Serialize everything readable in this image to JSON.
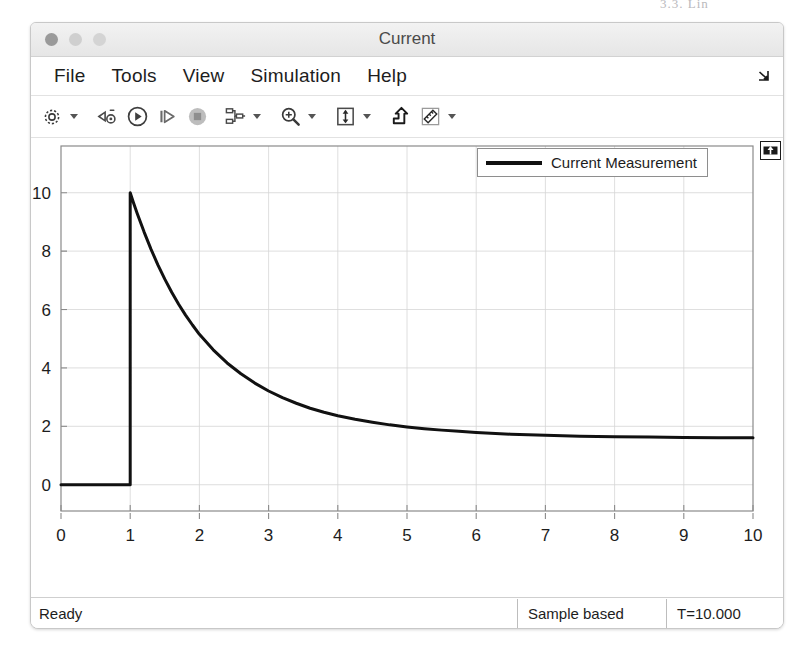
{
  "window": {
    "title": "Current",
    "traffic_lights": [
      "close-button",
      "minimize-button",
      "zoom-button"
    ],
    "top_artifact_text": "3.3. Lin"
  },
  "menubar": {
    "items": [
      {
        "label": "File",
        "name": "menu-file"
      },
      {
        "label": "Tools",
        "name": "menu-tools"
      },
      {
        "label": "View",
        "name": "menu-view"
      },
      {
        "label": "Simulation",
        "name": "menu-simulation"
      },
      {
        "label": "Help",
        "name": "menu-help"
      }
    ],
    "overflow_icon": "menu-overflow-arrow-icon"
  },
  "toolbar": {
    "buttons": [
      {
        "name": "configuration-properties-icon",
        "icon": "gear-icon",
        "has_caret": true
      },
      {
        "name": "simulation-stepping-options-icon",
        "icon": "stepping-gear-icon",
        "has_caret": false
      },
      {
        "name": "run-button-icon",
        "icon": "play-icon",
        "has_caret": false
      },
      {
        "name": "step-forward-icon",
        "icon": "step-forward-icon",
        "has_caret": false
      },
      {
        "name": "stop-button-icon",
        "icon": "stop-icon",
        "has_caret": false
      },
      {
        "name": "signal-selector-icon",
        "icon": "signal-tree-icon",
        "has_caret": true
      },
      {
        "name": "zoom-in-icon",
        "icon": "magnifier-plus-icon",
        "has_caret": true
      },
      {
        "name": "autoscale-icon",
        "icon": "fit-to-view-icon",
        "has_caret": true
      },
      {
        "name": "highlight-signal-icon",
        "icon": "highlight-arrow-icon",
        "has_caret": false
      },
      {
        "name": "cursor-measurements-icon",
        "icon": "ruler-icon",
        "has_caret": true
      }
    ]
  },
  "plot": {
    "pin_icon": "pin-to-top-icon",
    "legend": {
      "label": "Current Measurement",
      "line_color": "#111111"
    }
  },
  "statusbar": {
    "ready_label": "Ready",
    "sample_mode": "Sample based",
    "time_label": "T=10.000"
  },
  "chart_data": {
    "type": "line",
    "title": "",
    "xlabel": "",
    "ylabel": "",
    "xlim": [
      0,
      10
    ],
    "ylim": [
      -0.9,
      11.6
    ],
    "xticks": [
      0,
      1,
      2,
      3,
      4,
      5,
      6,
      7,
      8,
      9,
      10
    ],
    "yticks": [
      0,
      2,
      4,
      6,
      8,
      10
    ],
    "grid": true,
    "grid_color": "#d6d6d6",
    "series": [
      {
        "name": "Current Measurement",
        "color": "#111111",
        "line_width": 3,
        "x": [
          0,
          0.2,
          0.4,
          0.6,
          0.8,
          1.0,
          1.0,
          1.05,
          1.1,
          1.2,
          1.3,
          1.4,
          1.5,
          1.6,
          1.7,
          1.8,
          1.9,
          2.0,
          2.2,
          2.4,
          2.6,
          2.8,
          3.0,
          3.2,
          3.4,
          3.6,
          3.8,
          4.0,
          4.25,
          4.5,
          4.75,
          5.0,
          5.25,
          5.5,
          5.75,
          6.0,
          6.5,
          7.0,
          7.5,
          8.0,
          8.5,
          9.0,
          9.5,
          10.0
        ],
        "y": [
          0,
          0,
          0,
          0,
          0,
          0,
          10.0,
          9.64,
          9.3,
          8.66,
          8.07,
          7.53,
          7.04,
          6.59,
          6.18,
          5.81,
          5.47,
          5.15,
          4.62,
          4.17,
          3.8,
          3.48,
          3.21,
          2.98,
          2.79,
          2.62,
          2.48,
          2.36,
          2.24,
          2.14,
          2.05,
          1.98,
          1.92,
          1.87,
          1.83,
          1.79,
          1.73,
          1.69,
          1.66,
          1.64,
          1.63,
          1.62,
          1.61,
          1.61
        ]
      }
    ],
    "annotations": {
      "step_time": 1.0,
      "peak_value": 10.0,
      "steady_state": 1.1
    }
  }
}
